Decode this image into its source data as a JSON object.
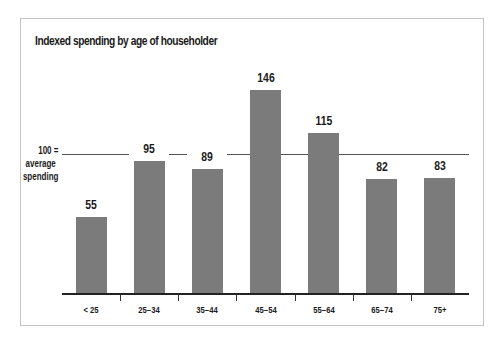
{
  "chart_data": {
    "type": "bar",
    "title": "Indexed spending by age of householder",
    "xlabel": "",
    "ylabel": "",
    "categories": [
      "< 25",
      "25–34",
      "35–44",
      "45–54",
      "55–64",
      "65–74",
      "75+"
    ],
    "values": [
      55,
      95,
      89,
      146,
      115,
      82,
      83
    ],
    "value_labels": [
      "55",
      "95",
      "89",
      "146",
      "115",
      "82",
      "83"
    ],
    "reference_line": {
      "value": 100,
      "label_line1": "100 =",
      "label_line2": "average",
      "label_line3": "spending"
    },
    "ylim": [
      0,
      160
    ],
    "grid": false,
    "legend": null,
    "bar_color": "#7b7b7b"
  }
}
